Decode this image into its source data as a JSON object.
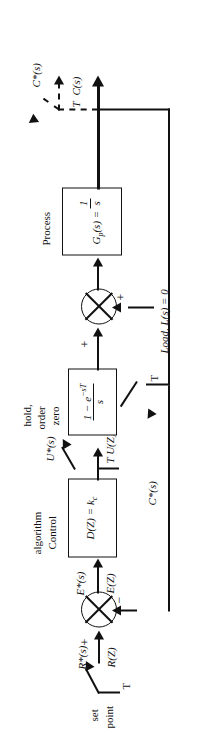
{
  "figure": {
    "type": "block-diagram",
    "orientation_deg": -90
  },
  "blocks": [
    {
      "id": "control-algorithm",
      "caption": "Control\nalgorithm",
      "caption_line1": "Control",
      "caption_line2": "algorithm",
      "transfer_function": "D(Z) = k",
      "transfer_subscript": "c"
    },
    {
      "id": "zero-order-hold",
      "caption_line1": "zero",
      "caption_line2": "order",
      "caption_line3": "hold,",
      "numerator": "1 − e",
      "numerator_exp": "−sT",
      "denominator": "s"
    },
    {
      "id": "process",
      "caption": "Process",
      "transfer_prefix": "G",
      "transfer_subscript": "p",
      "transfer_mid": "(s) =",
      "numerator": "1",
      "denominator": "s"
    }
  ],
  "signals": {
    "set_point_line1": "set",
    "set_point_line2": "point",
    "sampler_label": "T",
    "reference_star": "R*(s)",
    "reference_z": "R(Z)",
    "error_star": "E*(s)",
    "error_z": "E(Z)",
    "control_star": "U*(s)",
    "control_z": "T U(Z)",
    "load": "Load, L(s) = 0",
    "output": "C(s)",
    "output_star": "C*(s)",
    "feedback_star": "C*(s)"
  },
  "signs": {
    "summer1_plus": "+",
    "summer1_minus": "−",
    "summer2_plus_load": "+",
    "summer2_plus_process": "+"
  },
  "colors": {
    "ink": "#111111",
    "paper": "#ffffff"
  }
}
